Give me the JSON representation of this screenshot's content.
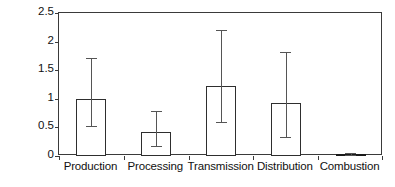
{
  "chart_data": {
    "type": "bar",
    "title": "",
    "subtitle": "",
    "xlabel": "",
    "ylabel": "Methane emissions (kg)",
    "categories": [
      "Production",
      "Processing",
      "Transmission",
      "Distribution",
      "Combustion"
    ],
    "values": [
      1.0,
      0.42,
      1.22,
      0.92,
      0.03
    ],
    "error_low": [
      0.52,
      0.17,
      0.59,
      0.34,
      0.01
    ],
    "error_high": [
      1.72,
      0.79,
      2.21,
      1.82,
      0.05
    ],
    "ylim": [
      0,
      2.5
    ],
    "yticks": [
      0,
      0.5,
      1,
      1.5,
      2,
      2.5
    ],
    "ytick_labels": [
      "0",
      "0.5",
      "1",
      "1.5",
      "2",
      "2.5"
    ],
    "grid": false,
    "legend": "none",
    "series": [
      {
        "name": "Methane emissions",
        "values": [
          1.0,
          0.42,
          1.22,
          0.92,
          0.03
        ],
        "error_low": [
          0.52,
          0.17,
          0.59,
          0.34,
          0.01
        ],
        "error_high": [
          1.72,
          0.79,
          2.21,
          1.82,
          0.05
        ]
      }
    ],
    "bar_fill_color": "#ffffff",
    "bar_edge_color": "#2e2e2e",
    "errorbar_color": "#555555",
    "axis_color": "#3a3a3a",
    "text_color": "#111111"
  }
}
